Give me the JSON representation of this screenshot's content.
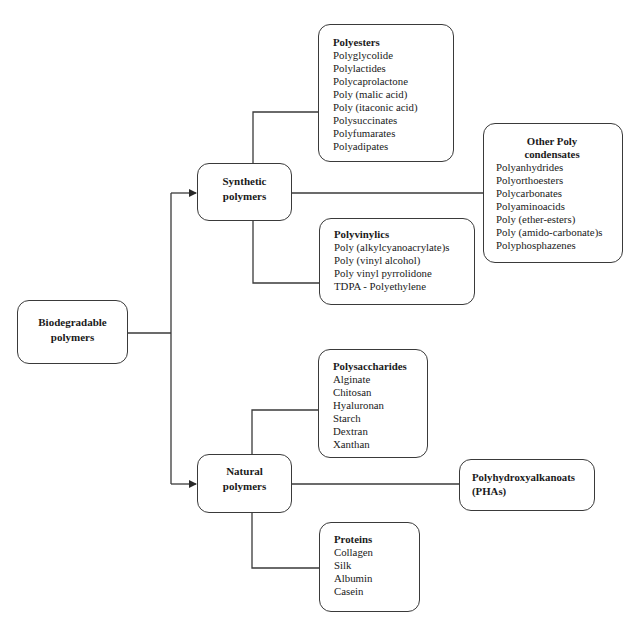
{
  "root": {
    "label_line1": "Biodegradable",
    "label_line2": "polymers"
  },
  "synthetic": {
    "label_line1": "Synthetic",
    "label_line2": "polymers",
    "children": {
      "polyesters": {
        "title": "Polyesters",
        "items": [
          "Polyglycolide",
          "Polylactides",
          "Polycaprolactone",
          "Poly (malic acid)",
          "Poly (itaconic acid)",
          "Polysuccinates",
          "Polyfumarates",
          "Polyadipates"
        ]
      },
      "other_poly_condensates": {
        "title_line1": "Other Poly",
        "title_line2": "condensates",
        "items": [
          "Polyanhydrides",
          "Polyorthoesters",
          "Polycarbonates",
          "Polyaminoacids",
          "Poly (ether-esters)",
          "Poly (amido-carbonate)s",
          "Polyphosphazenes"
        ]
      },
      "polyvinylics": {
        "title": "Polyvinylics",
        "items": [
          "Poly (alkylcyanoacrylate)s",
          "Poly (vinyl alcohol)",
          "Poly vinyl pyrrolidone",
          "TDPA - Polyethylene"
        ]
      }
    }
  },
  "natural": {
    "label_line1": "Natural",
    "label_line2": "polymers",
    "children": {
      "polysaccharides": {
        "title": "Polysaccharides",
        "items": [
          "Alginate",
          "Chitosan",
          "Hyaluronan",
          "Starch",
          "Dextran",
          "Xanthan"
        ]
      },
      "phas": {
        "title_line1": "Polyhydroxyalkanoats",
        "title_line2": "(PHAs)"
      },
      "proteins": {
        "title": "Proteins",
        "items": [
          "Collagen",
          "Silk",
          "Albumin",
          "Casein"
        ]
      }
    }
  },
  "colors": {
    "line": "#3a3a3a",
    "text": "#1a1a1a",
    "background": "#ffffff"
  }
}
